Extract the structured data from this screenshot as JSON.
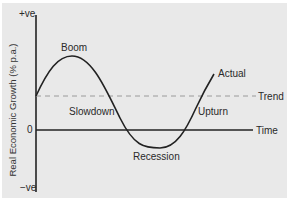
{
  "diagram": {
    "type": "business-cycle",
    "y_axis": {
      "label": "Real Economic Growth (% p.a.)",
      "top_label": "+ve",
      "zero_label": "0",
      "bottom_label": "−ve"
    },
    "x_axis": {
      "label": "Time"
    },
    "lines": {
      "actual": "Actual",
      "trend": "Trend"
    },
    "phases": {
      "boom": "Boom",
      "slowdown": "Slowdown",
      "recession": "Recession",
      "upturn": "Upturn"
    },
    "colors": {
      "background": "#e9e9e9",
      "line": "#222222",
      "trend": "#9a9a9a",
      "text": "#2a2a2a"
    }
  }
}
